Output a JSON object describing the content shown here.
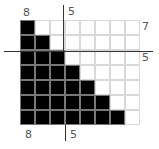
{
  "diagram": {
    "type": "staircase-grid",
    "columns": 8,
    "rows": 7,
    "filled_per_row": [
      1,
      2,
      3,
      4,
      5,
      6,
      7
    ],
    "fill_color": "#000000",
    "grid_color": "#d8d8d8"
  },
  "labels": {
    "top_left": "8",
    "top_center": "5",
    "right_top": "7",
    "right_middle": "5",
    "bottom_left": "8",
    "bottom_center": "5"
  }
}
